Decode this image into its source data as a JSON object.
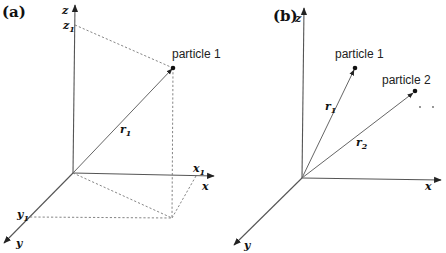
{
  "panels": {
    "a": {
      "label": "(a)",
      "axes": {
        "x": "x",
        "y": "y",
        "z": "z"
      },
      "coords": {
        "x1": "x",
        "x1_sub": "1",
        "y1": "y",
        "y1_sub": "1",
        "z1": "z",
        "z1_sub": "1"
      },
      "vector": {
        "name": "r",
        "sub": "1"
      },
      "particle": "particle 1"
    },
    "b": {
      "label": "(b)",
      "axes": {
        "x": "x",
        "y": "y",
        "z": "z"
      },
      "vectors": [
        {
          "name": "r",
          "sub": "1"
        },
        {
          "name": "r",
          "sub": "2"
        }
      ],
      "particles": [
        "particle 1",
        "particle 2"
      ]
    }
  },
  "colors": {
    "line": "#555555",
    "text": "#111111",
    "background": "#ffffff"
  }
}
